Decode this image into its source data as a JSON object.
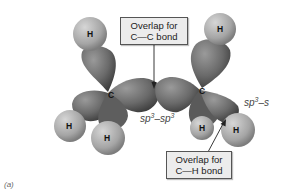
{
  "diagram": {
    "panel_label": "(a)",
    "callouts": {
      "cc": {
        "line1": "Overlap for",
        "line2": "C—C bond"
      },
      "ch": {
        "line1": "Overlap for",
        "line2": "C—H bond"
      }
    },
    "labels": {
      "sp3sp3": {
        "base1": "sp",
        "sup1": "3",
        "dash": "–",
        "base2": "sp",
        "sup2": "3"
      },
      "sp3s": {
        "base1": "sp",
        "sup1": "3",
        "dash": "–",
        "base2": "s"
      }
    },
    "atoms": {
      "carbon": "C",
      "hydrogen": "H"
    },
    "colors": {
      "orbital": "#6f6f6f",
      "hydrogen": "#a9a9a9",
      "callout_bg": "#ececec"
    }
  }
}
